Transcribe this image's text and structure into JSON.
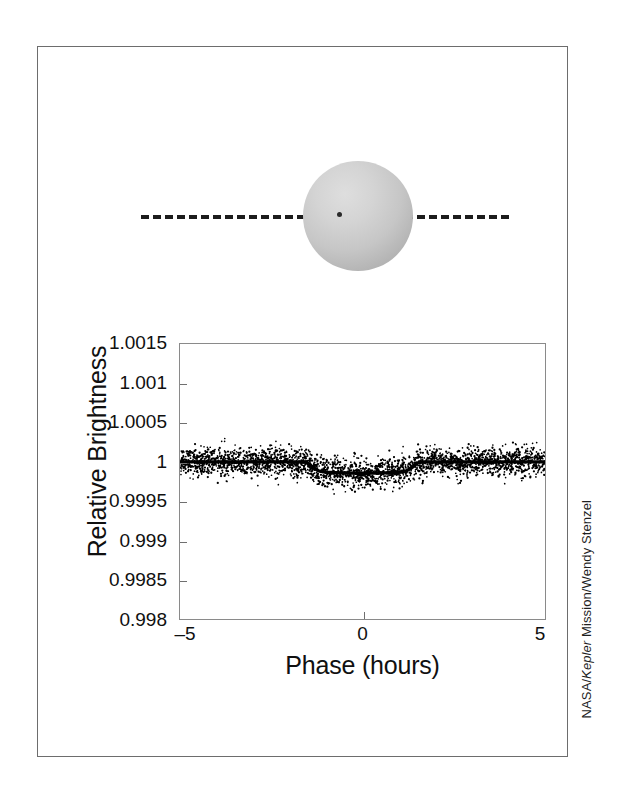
{
  "figure": {
    "credit_prefix": "NASA/",
    "credit_italic": "Kepler",
    "credit_suffix": " Mission/Wendy Stenzel"
  },
  "illustration": {
    "star_name": "star-disc",
    "orbit_line_name": "orbit-path-dashed",
    "planet_name": "transiting-planet-dot"
  },
  "chart_data": {
    "type": "scatter",
    "title": "",
    "subtitle": "",
    "xlabel": "Phase (hours)",
    "ylabel": "Relative Brightness",
    "xlim": [
      -5,
      5
    ],
    "ylim": [
      0.998,
      1.0015
    ],
    "grid": false,
    "legend": null,
    "xticks": [
      -5,
      0,
      5
    ],
    "xtick_labels": [
      "–5",
      "0",
      "5"
    ],
    "yticks": [
      1.0015,
      1.001,
      1.0005,
      1,
      0.9995,
      0.999,
      0.9985,
      0.998
    ],
    "ytick_labels": [
      "1.0015",
      "1.001",
      "1.0005",
      "1",
      "0.9995",
      "0.999",
      "0.9985",
      "0.998"
    ],
    "scatter": {
      "name": "Kepler photometry",
      "marker": "point",
      "color": "#000000",
      "point_count": 2600,
      "noise_sigma": 9e-05,
      "description": "Phase-folded relative brightness measurements scattered about the transit model"
    },
    "series": [
      {
        "name": "Transit model",
        "type": "line",
        "color": "#000000",
        "x": [
          -5.0,
          -4.5,
          -4.0,
          -3.5,
          -3.0,
          -2.5,
          -2.0,
          -1.75,
          -1.55,
          -1.45,
          -1.35,
          -1.2,
          -1.0,
          -0.75,
          -0.5,
          -0.25,
          0.0,
          0.25,
          0.5,
          0.75,
          1.0,
          1.2,
          1.35,
          1.45,
          1.55,
          1.75,
          2.0,
          2.5,
          3.0,
          3.5,
          4.0,
          4.5,
          5.0
        ],
        "y": [
          1.0,
          1.0,
          1.0,
          1.0,
          1.0,
          1.0,
          1.0,
          1.0,
          0.999995,
          0.999965,
          0.999925,
          0.999885,
          0.999868,
          0.999862,
          0.999858,
          0.999856,
          0.999855,
          0.999856,
          0.999858,
          0.999862,
          0.999868,
          0.999885,
          0.999925,
          0.999965,
          0.999995,
          1.0,
          1.0,
          1.0,
          1.0,
          1.0,
          1.0,
          1.0,
          1.0
        ]
      }
    ],
    "transit": {
      "depth": 0.000145,
      "duration_hours": 3.1,
      "center_phase_hours": 0.0,
      "ingress_hours": -1.55,
      "egress_hours": 1.55,
      "baseline": 1.0
    }
  }
}
